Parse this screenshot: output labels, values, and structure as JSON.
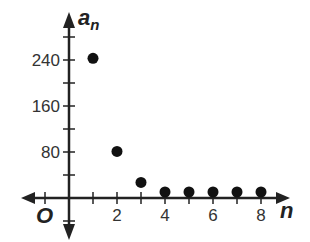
{
  "chart_data": {
    "type": "scatter",
    "title": "",
    "xlabel": "n",
    "ylabel": "a_n",
    "ylabel_main": "a",
    "ylabel_sub": "n",
    "origin_label": "O",
    "x": [
      1,
      2,
      3,
      4,
      5,
      6,
      7,
      8
    ],
    "y": [
      243,
      81,
      27,
      9,
      3,
      1,
      0.33,
      0.11
    ],
    "xlim": [
      -2,
      9
    ],
    "ylim": [
      -70,
      300
    ],
    "x_ticks": [
      -1,
      1,
      2,
      3,
      4,
      5,
      6,
      7,
      8
    ],
    "x_tick_labels": [
      {
        "value": 2,
        "label": "2"
      },
      {
        "value": 4,
        "label": "4"
      },
      {
        "value": 6,
        "label": "6"
      },
      {
        "value": 8,
        "label": "8"
      }
    ],
    "y_ticks": [
      -40,
      40,
      80,
      120,
      160,
      200,
      240,
      280
    ],
    "y_tick_labels": [
      {
        "value": 80,
        "label": "80"
      },
      {
        "value": 160,
        "label": "160"
      },
      {
        "value": 240,
        "label": "240"
      }
    ],
    "grid": false,
    "legend": null,
    "marker_color": "#111111",
    "axis_color": "#222222"
  }
}
